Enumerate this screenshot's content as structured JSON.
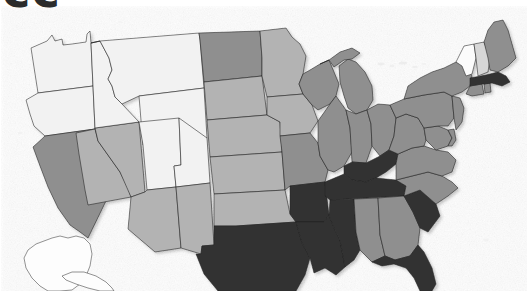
{
  "heading": {
    "text": "cc",
    "note": "partially cropped dark heading text at top-left edge"
  },
  "map": {
    "title": "United States choropleth map",
    "projection": "albers-usa",
    "background_color": "#ffffff",
    "border_color": "#1d1d1d",
    "shade_scale": {
      "lightest": "#f2f2f2",
      "light": "#d7d7d7",
      "medium": "#b3b3b3",
      "dark": "#8f8f8f",
      "darkest": "#333333"
    },
    "inset_label": "Alaska",
    "states": [
      {
        "code": "WA",
        "name": "Washington",
        "shade": "lightest",
        "color": "#f2f2f2"
      },
      {
        "code": "OR",
        "name": "Oregon",
        "shade": "lightest",
        "color": "#f2f2f2"
      },
      {
        "code": "ID",
        "name": "Idaho",
        "shade": "lightest",
        "color": "#f2f2f2"
      },
      {
        "code": "MT",
        "name": "Montana",
        "shade": "lightest",
        "color": "#f2f2f2"
      },
      {
        "code": "WY",
        "name": "Wyoming",
        "shade": "lightest",
        "color": "#f2f2f2"
      },
      {
        "code": "UT",
        "name": "Utah",
        "shade": "lightest",
        "color": "#f2f2f2"
      },
      {
        "code": "CO",
        "name": "Colorado",
        "shade": "lightest",
        "color": "#f2f2f2"
      },
      {
        "code": "CA",
        "name": "California",
        "shade": "dark",
        "color": "#8f8f8f"
      },
      {
        "code": "NV",
        "name": "Nevada",
        "shade": "medium",
        "color": "#b3b3b3"
      },
      {
        "code": "AZ",
        "name": "Arizona",
        "shade": "medium",
        "color": "#b3b3b3"
      },
      {
        "code": "NM",
        "name": "New Mexico",
        "shade": "medium",
        "color": "#b3b3b3"
      },
      {
        "code": "ND",
        "name": "North Dakota",
        "shade": "dark",
        "color": "#8f8f8f"
      },
      {
        "code": "SD",
        "name": "South Dakota",
        "shade": "medium",
        "color": "#b3b3b3"
      },
      {
        "code": "NE",
        "name": "Nebraska",
        "shade": "medium",
        "color": "#b3b3b3"
      },
      {
        "code": "KS",
        "name": "Kansas",
        "shade": "medium",
        "color": "#b3b3b3"
      },
      {
        "code": "OK",
        "name": "Oklahoma",
        "shade": "medium",
        "color": "#b3b3b3"
      },
      {
        "code": "TX",
        "name": "Texas",
        "shade": "darkest",
        "color": "#333333"
      },
      {
        "code": "MN",
        "name": "Minnesota",
        "shade": "medium",
        "color": "#b3b3b3"
      },
      {
        "code": "IA",
        "name": "Iowa",
        "shade": "medium",
        "color": "#b3b3b3"
      },
      {
        "code": "MO",
        "name": "Missouri",
        "shade": "dark",
        "color": "#8f8f8f"
      },
      {
        "code": "AR",
        "name": "Arkansas",
        "shade": "darkest",
        "color": "#333333"
      },
      {
        "code": "LA",
        "name": "Louisiana",
        "shade": "darkest",
        "color": "#333333"
      },
      {
        "code": "WI",
        "name": "Wisconsin",
        "shade": "dark",
        "color": "#8f8f8f"
      },
      {
        "code": "IL",
        "name": "Illinois",
        "shade": "dark",
        "color": "#8f8f8f"
      },
      {
        "code": "MI",
        "name": "Michigan",
        "shade": "dark",
        "color": "#8f8f8f"
      },
      {
        "code": "IN",
        "name": "Indiana",
        "shade": "dark",
        "color": "#8f8f8f"
      },
      {
        "code": "OH",
        "name": "Ohio",
        "shade": "dark",
        "color": "#8f8f8f"
      },
      {
        "code": "KY",
        "name": "Kentucky",
        "shade": "darkest",
        "color": "#333333"
      },
      {
        "code": "TN",
        "name": "Tennessee",
        "shade": "darkest",
        "color": "#333333"
      },
      {
        "code": "MS",
        "name": "Mississippi",
        "shade": "darkest",
        "color": "#333333"
      },
      {
        "code": "AL",
        "name": "Alabama",
        "shade": "dark",
        "color": "#8f8f8f"
      },
      {
        "code": "GA",
        "name": "Georgia",
        "shade": "dark",
        "color": "#8f8f8f"
      },
      {
        "code": "FL",
        "name": "Florida",
        "shade": "darkest",
        "color": "#333333"
      },
      {
        "code": "SC",
        "name": "South Carolina",
        "shade": "darkest",
        "color": "#333333"
      },
      {
        "code": "NC",
        "name": "North Carolina",
        "shade": "dark",
        "color": "#8f8f8f"
      },
      {
        "code": "VA",
        "name": "Virginia",
        "shade": "dark",
        "color": "#8f8f8f"
      },
      {
        "code": "WV",
        "name": "West Virginia",
        "shade": "dark",
        "color": "#8f8f8f"
      },
      {
        "code": "MD",
        "name": "Maryland",
        "shade": "dark",
        "color": "#8f8f8f"
      },
      {
        "code": "DE",
        "name": "Delaware",
        "shade": "dark",
        "color": "#8f8f8f"
      },
      {
        "code": "PA",
        "name": "Pennsylvania",
        "shade": "dark",
        "color": "#8f8f8f"
      },
      {
        "code": "NJ",
        "name": "New Jersey",
        "shade": "dark",
        "color": "#8f8f8f"
      },
      {
        "code": "NY",
        "name": "New York",
        "shade": "dark",
        "color": "#8f8f8f"
      },
      {
        "code": "CT",
        "name": "Connecticut",
        "shade": "dark",
        "color": "#8f8f8f"
      },
      {
        "code": "RI",
        "name": "Rhode Island",
        "shade": "dark",
        "color": "#8f8f8f"
      },
      {
        "code": "MA",
        "name": "Massachusetts",
        "shade": "darkest",
        "color": "#333333"
      },
      {
        "code": "VT",
        "name": "Vermont",
        "shade": "lightest",
        "color": "#fbfbfb"
      },
      {
        "code": "NH",
        "name": "New Hampshire",
        "shade": "light",
        "color": "#d7d7d7"
      },
      {
        "code": "ME",
        "name": "Maine",
        "shade": "dark",
        "color": "#8f8f8f"
      },
      {
        "code": "AK",
        "name": "Alaska",
        "shade": "lightest",
        "color": "#fdfdfd"
      }
    ]
  }
}
